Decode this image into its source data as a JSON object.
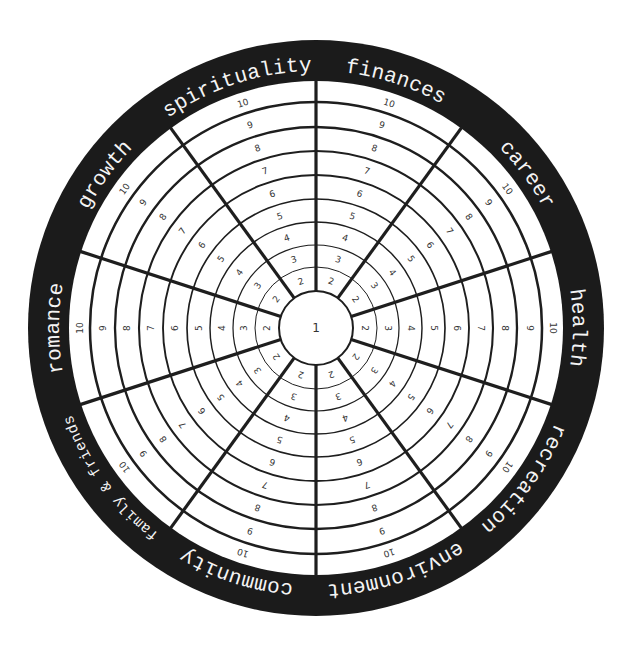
{
  "geometry": {
    "cx": 316,
    "cy": 328,
    "outer_radius": 288,
    "inner_radius": 247,
    "label_radius": 263,
    "center_radius": 37,
    "ring_radii": [
      61,
      83,
      106,
      129,
      153,
      177,
      201,
      226
    ],
    "sector_count": 10,
    "first_spoke_angle_deg": 0
  },
  "colors": {
    "background": "#ffffff",
    "outer_ring": "#1b1b1b",
    "label_text": "#f4f4f4",
    "lines": "#1e1e1e",
    "numbers": "#333333"
  },
  "center_label": "1",
  "band_numbers": [
    "2",
    "3",
    "4",
    "5",
    "6",
    "7",
    "8",
    "9",
    "10"
  ],
  "sectors": [
    {
      "label": "finances",
      "center_angle_deg": 18
    },
    {
      "label": "career",
      "center_angle_deg": 54
    },
    {
      "label": "health",
      "center_angle_deg": 90
    },
    {
      "label": "recreation",
      "center_angle_deg": 126
    },
    {
      "label": "environment",
      "center_angle_deg": 162
    },
    {
      "label": "community",
      "center_angle_deg": 198
    },
    {
      "label": "family & friends",
      "center_angle_deg": 234,
      "small": true
    },
    {
      "label": "romance",
      "center_angle_deg": 270
    },
    {
      "label": "growth",
      "center_angle_deg": 306
    },
    {
      "label": "spirituality",
      "center_angle_deg": 342
    }
  ]
}
